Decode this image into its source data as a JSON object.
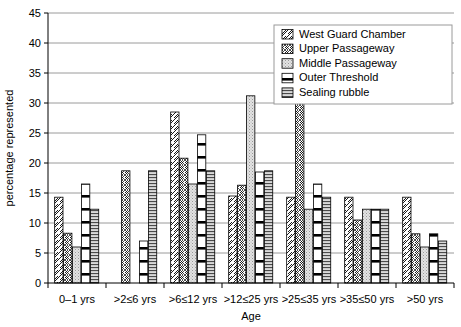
{
  "chart_data": {
    "type": "bar",
    "title": "",
    "xlabel": "Age",
    "ylabel": "percentage represented",
    "ylim": [
      0,
      45
    ],
    "ytick_step": 5,
    "yticks": [
      "0",
      "5",
      "10",
      "15",
      "20",
      "25",
      "30",
      "35",
      "40",
      "45"
    ],
    "grid": true,
    "legend_position": "top-right",
    "categories": [
      "0–1 yrs",
      ">2≤6 yrs",
      ">6≤12 yrs",
      ">12≤25 yrs",
      ">25≤35 yrs",
      ">35≤50 yrs",
      ">50 yrs"
    ],
    "series": [
      {
        "name": "West Guard Chamber",
        "pattern": "diagonal-hatch",
        "values": [
          14.3,
          0,
          28.5,
          14.5,
          14.3,
          14.3,
          14.3
        ]
      },
      {
        "name": "Upper Passageway",
        "pattern": "cross-hatch",
        "values": [
          8.3,
          18.7,
          20.8,
          16.3,
          41.7,
          10.5,
          8.2
        ]
      },
      {
        "name": "Middle Passageway",
        "pattern": "light-stipple",
        "values": [
          6.0,
          0,
          16.5,
          31.2,
          12.3,
          12.3,
          6.0
        ]
      },
      {
        "name": "Outer Threshold",
        "pattern": "thick-horizontal-bands",
        "values": [
          16.5,
          7.0,
          24.7,
          18.5,
          16.5,
          12.3,
          8.2
        ]
      },
      {
        "name": "Sealing rubble",
        "pattern": "fine-horizontal-lines",
        "values": [
          12.3,
          18.7,
          18.7,
          18.7,
          14.3,
          12.3,
          7.0
        ]
      }
    ]
  },
  "legend": {
    "items": [
      {
        "label": "West Guard Chamber"
      },
      {
        "label": "Upper Passageway"
      },
      {
        "label": "Middle Passageway"
      },
      {
        "label": "Outer Threshold"
      },
      {
        "label": "Sealing rubble"
      }
    ]
  },
  "colors": {
    "axis": "#000000",
    "grid": "#808080",
    "bar_outline": "#000000",
    "background": "#ffffff"
  }
}
